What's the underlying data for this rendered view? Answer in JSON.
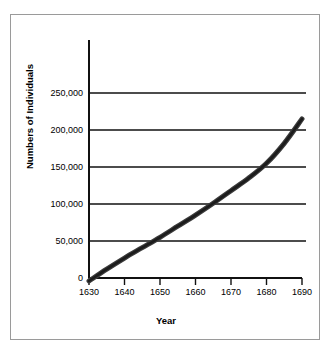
{
  "chart_data": {
    "type": "line",
    "title": "",
    "xlabel": "Year",
    "ylabel": "Numbers of Individuals",
    "xlim": [
      1630,
      1690
    ],
    "ylim": [
      0,
      250000
    ],
    "grid": true,
    "legend": false,
    "x_ticks": [
      "1630",
      "1640",
      "1650",
      "1660",
      "1670",
      "1680",
      "1690"
    ],
    "x_tick_values": [
      1630,
      1640,
      1650,
      1660,
      1670,
      1680,
      1690
    ],
    "y_ticks": [
      "0",
      "50,000",
      "100,000",
      "150,000",
      "200,000",
      "250,000"
    ],
    "y_tick_values": [
      0,
      50000,
      100000,
      150000,
      200000,
      250000
    ],
    "series": [
      {
        "name": "Population",
        "color": "#3c3c3c",
        "x": [
          1630,
          1635,
          1640,
          1645,
          1650,
          1655,
          1660,
          1665,
          1670,
          1675,
          1680,
          1685,
          1690
        ],
        "values": [
          -4000,
          12000,
          27000,
          41000,
          55000,
          70000,
          85000,
          101000,
          118000,
          135000,
          155000,
          182000,
          215000
        ]
      }
    ],
    "annotations": []
  },
  "figure": {
    "border_color": "#9a9a9a",
    "background": "#ffffff",
    "line_color": "#3c3c3c",
    "axis_color": "#111111"
  }
}
